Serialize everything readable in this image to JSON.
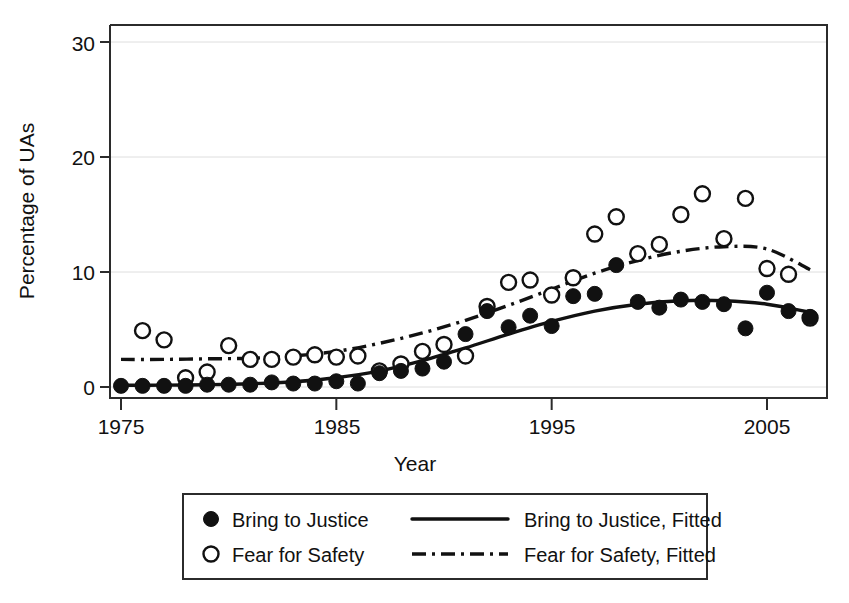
{
  "chart_data": {
    "type": "scatter",
    "title": "",
    "xlabel": "Year",
    "ylabel": "Percentage of UAs",
    "xlim": [
      1975,
      1982
    ],
    "x_axis_range": [
      1975,
      2008
    ],
    "ylim": [
      0,
      32
    ],
    "xticks": [
      1975,
      1985,
      1995,
      2005
    ],
    "xtick_labels": [
      "1975",
      "1985",
      "1995",
      "2005"
    ],
    "yticks": [
      0,
      10,
      20,
      30
    ],
    "ytick_labels": [
      "0",
      "10",
      "20",
      "30"
    ],
    "grid": "horizontal-light",
    "legend_position": "below-plot",
    "series": [
      {
        "name": "Bring to Justice",
        "marker": "filled-circle",
        "type": "scatter",
        "x": [
          1975,
          1976,
          1977,
          1978,
          1979,
          1980,
          1981,
          1982,
          1983,
          1984,
          1985,
          1986,
          1987,
          1988,
          1989,
          1990,
          1991,
          1992,
          1993,
          1994,
          1995,
          1996,
          1997,
          1998,
          1999,
          2000,
          2001,
          2002,
          2003,
          2004,
          2005,
          2006,
          2007
        ],
        "values": [
          0.1,
          0.1,
          0.1,
          0.1,
          0.2,
          0.2,
          0.2,
          0.4,
          0.3,
          0.3,
          0.5,
          0.3,
          1.2,
          1.4,
          1.6,
          2.2,
          4.6,
          6.6,
          5.2,
          6.2,
          5.3,
          7.9,
          8.1,
          10.6,
          7.4,
          6.9,
          7.6,
          7.4,
          7.2,
          5.1,
          8.2,
          6.6,
          6.1
        ]
      },
      {
        "name": "Fear for Safety",
        "marker": "open-circle",
        "type": "scatter",
        "x": [
          1976,
          1977,
          1978,
          1979,
          1980,
          1981,
          1982,
          1983,
          1984,
          1985,
          1986,
          1987,
          1988,
          1989,
          1990,
          1991,
          1992,
          1993,
          1994,
          1995,
          1996,
          1997,
          1998,
          1999,
          2000,
          2001,
          2002,
          2003,
          2004,
          2005,
          2006,
          2007
        ],
        "values": [
          4.9,
          4.1,
          0.8,
          1.3,
          3.6,
          2.4,
          2.4,
          2.6,
          2.8,
          2.6,
          2.7,
          1.4,
          2.0,
          3.1,
          3.7,
          2.7,
          7.0,
          9.1,
          9.3,
          8.0,
          9.5,
          13.3,
          14.8,
          11.6,
          12.4,
          15.0,
          16.8,
          12.9,
          16.4,
          10.3,
          9.8,
          6.0
        ]
      },
      {
        "name": "Bring to Justice, Fitted",
        "marker": "none",
        "type": "line",
        "style": "solid",
        "x": [
          1975,
          1977,
          1979,
          1981,
          1983,
          1985,
          1987,
          1989,
          1991,
          1993,
          1995,
          1997,
          1999,
          2001,
          2003,
          2005,
          2007
        ],
        "values": [
          0.15,
          0.16,
          0.2,
          0.28,
          0.45,
          0.8,
          1.4,
          2.3,
          3.4,
          4.6,
          5.7,
          6.6,
          7.2,
          7.5,
          7.5,
          7.2,
          6.5
        ]
      },
      {
        "name": "Fear for Safety, Fitted",
        "marker": "none",
        "type": "line",
        "style": "dash-dot",
        "x": [
          1975,
          1977,
          1979,
          1981,
          1983,
          1985,
          1987,
          1989,
          1991,
          1993,
          1995,
          1997,
          1999,
          2001,
          2003,
          2005,
          2007
        ],
        "values": [
          2.4,
          2.4,
          2.45,
          2.5,
          2.7,
          3.1,
          3.8,
          4.7,
          5.8,
          7.1,
          8.5,
          9.9,
          11.0,
          11.8,
          12.2,
          12.0,
          10.2
        ]
      }
    ]
  },
  "axes": {
    "y_title": "Percentage of UAs",
    "x_title": "Year",
    "x_tick_labels": [
      "1975",
      "1985",
      "1995",
      "2005"
    ],
    "y_tick_labels": [
      "30",
      "20",
      "10",
      "0"
    ]
  },
  "legend": {
    "entries": [
      {
        "label": "Bring to Justice",
        "glyph": "filled-circle-marker"
      },
      {
        "label": "Bring to Justice, Fitted",
        "glyph": "solid-line-swatch"
      },
      {
        "label": "Fear for Safety",
        "glyph": "open-circle-marker"
      },
      {
        "label": "Fear for Safety, Fitted",
        "glyph": "dash-dot-line-swatch"
      }
    ]
  },
  "colors": {
    "ink": "#111111",
    "frame": "#2b2b2b",
    "grid": "#dedede",
    "background": "#ffffff"
  }
}
